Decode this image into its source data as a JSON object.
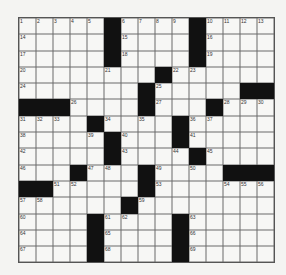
{
  "puzzle": {
    "type": "crossword",
    "size": {
      "rows": 15,
      "cols": 15
    },
    "grid": [
      ".....#....#....",
      ".....#....#....",
      ".....#....#....",
      "........#......",
      ".......#.....##",
      "###....#...#...",
      "....#....#.....",
      ".....#...#.....",
      ".....#....#....",
      "...#...#....###",
      "##.....#.......",
      "......#........",
      "....#....#.....",
      "....#....#.....",
      "....#....#....."
    ],
    "numbers": [
      {
        "row": 0,
        "col": 0,
        "n": "1"
      },
      {
        "row": 0,
        "col": 1,
        "n": "2"
      },
      {
        "row": 0,
        "col": 2,
        "n": "3"
      },
      {
        "row": 0,
        "col": 3,
        "n": "4"
      },
      {
        "row": 0,
        "col": 4,
        "n": "5"
      },
      {
        "row": 0,
        "col": 6,
        "n": "6"
      },
      {
        "row": 0,
        "col": 7,
        "n": "7"
      },
      {
        "row": 0,
        "col": 8,
        "n": "8"
      },
      {
        "row": 0,
        "col": 9,
        "n": "9"
      },
      {
        "row": 0,
        "col": 11,
        "n": "10"
      },
      {
        "row": 0,
        "col": 12,
        "n": "11"
      },
      {
        "row": 0,
        "col": 13,
        "n": "12"
      },
      {
        "row": 0,
        "col": 14,
        "n": "13"
      },
      {
        "row": 1,
        "col": 0,
        "n": "14"
      },
      {
        "row": 1,
        "col": 6,
        "n": "15"
      },
      {
        "row": 1,
        "col": 11,
        "n": "16"
      },
      {
        "row": 2,
        "col": 0,
        "n": "17"
      },
      {
        "row": 2,
        "col": 6,
        "n": "18"
      },
      {
        "row": 2,
        "col": 11,
        "n": "19"
      },
      {
        "row": 3,
        "col": 0,
        "n": "20"
      },
      {
        "row": 3,
        "col": 5,
        "n": "21"
      },
      {
        "row": 3,
        "col": 9,
        "n": "22"
      },
      {
        "row": 3,
        "col": 10,
        "n": "23"
      },
      {
        "row": 4,
        "col": 0,
        "n": "24"
      },
      {
        "row": 4,
        "col": 8,
        "n": "25"
      },
      {
        "row": 5,
        "col": 3,
        "n": "26"
      },
      {
        "row": 5,
        "col": 8,
        "n": "27"
      },
      {
        "row": 5,
        "col": 12,
        "n": "28"
      },
      {
        "row": 5,
        "col": 13,
        "n": "29"
      },
      {
        "row": 5,
        "col": 14,
        "n": "30"
      },
      {
        "row": 6,
        "col": 0,
        "n": "31"
      },
      {
        "row": 6,
        "col": 1,
        "n": "32"
      },
      {
        "row": 6,
        "col": 2,
        "n": "33"
      },
      {
        "row": 6,
        "col": 5,
        "n": "34"
      },
      {
        "row": 6,
        "col": 7,
        "n": "35"
      },
      {
        "row": 6,
        "col": 10,
        "n": "36"
      },
      {
        "row": 6,
        "col": 11,
        "n": "37"
      },
      {
        "row": 7,
        "col": 0,
        "n": "38"
      },
      {
        "row": 7,
        "col": 4,
        "n": "39"
      },
      {
        "row": 7,
        "col": 6,
        "n": "40"
      },
      {
        "row": 7,
        "col": 10,
        "n": "41"
      },
      {
        "row": 8,
        "col": 0,
        "n": "42"
      },
      {
        "row": 8,
        "col": 6,
        "n": "43"
      },
      {
        "row": 8,
        "col": 9,
        "n": "44"
      },
      {
        "row": 8,
        "col": 11,
        "n": "45"
      },
      {
        "row": 9,
        "col": 0,
        "n": "46"
      },
      {
        "row": 9,
        "col": 4,
        "n": "47"
      },
      {
        "row": 9,
        "col": 5,
        "n": "48"
      },
      {
        "row": 9,
        "col": 8,
        "n": "49"
      },
      {
        "row": 9,
        "col": 10,
        "n": "50"
      },
      {
        "row": 10,
        "col": 2,
        "n": "51"
      },
      {
        "row": 10,
        "col": 3,
        "n": "52"
      },
      {
        "row": 10,
        "col": 8,
        "n": "53"
      },
      {
        "row": 10,
        "col": 12,
        "n": "54"
      },
      {
        "row": 10,
        "col": 13,
        "n": "55"
      },
      {
        "row": 10,
        "col": 14,
        "n": "56"
      },
      {
        "row": 11,
        "col": 0,
        "n": "57"
      },
      {
        "row": 11,
        "col": 1,
        "n": "58"
      },
      {
        "row": 11,
        "col": 7,
        "n": "59"
      },
      {
        "row": 12,
        "col": 0,
        "n": "60"
      },
      {
        "row": 12,
        "col": 5,
        "n": "61"
      },
      {
        "row": 12,
        "col": 6,
        "n": "62"
      },
      {
        "row": 12,
        "col": 10,
        "n": "63"
      },
      {
        "row": 13,
        "col": 0,
        "n": "64"
      },
      {
        "row": 13,
        "col": 5,
        "n": "65"
      },
      {
        "row": 13,
        "col": 10,
        "n": "66"
      },
      {
        "row": 14,
        "col": 0,
        "n": "67"
      },
      {
        "row": 14,
        "col": 5,
        "n": "68"
      },
      {
        "row": 14,
        "col": 10,
        "n": "69"
      }
    ],
    "colors": {
      "block": "#111111",
      "cell": "#f7f7f5",
      "line": "#555555"
    }
  }
}
